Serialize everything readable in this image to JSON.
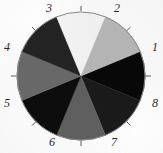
{
  "figure": {
    "kind": "pie-chart",
    "background_color": "#fdfdfd",
    "outline_color": "#8a8a8a",
    "label_color": "#2b2b2b",
    "tick_color": "#4a4a4a",
    "center_x": 66,
    "center_y": 66,
    "radius": 64
  },
  "chart_data": {
    "type": "pie",
    "title": "",
    "subtitle": "",
    "xlabel": "",
    "ylabel": "",
    "legend_position": "none",
    "grid": false,
    "labels_outside": true,
    "start_angle_deg": 0,
    "direction": "clockwise",
    "slice_count": 8,
    "categories": [
      "1",
      "2",
      "3",
      "4",
      "5",
      "6",
      "7",
      "8"
    ],
    "values": [
      12.5,
      12.5,
      12.5,
      12.5,
      12.5,
      12.5,
      12.5,
      12.5
    ],
    "angles_deg": [
      45,
      45,
      45,
      45,
      45,
      45,
      45,
      45
    ],
    "colors": [
      "#080808",
      "#1a1a1a",
      "#606060",
      "#0d0d0d",
      "#6a6a6a",
      "#232323",
      "#f5f5f5",
      "#b8b8b8"
    ],
    "slices": [
      {
        "label": "1",
        "value": 12.5,
        "angle_deg": 45,
        "color": "#080808",
        "start_deg": -22.5,
        "end_deg": 22.5,
        "label_x": 152,
        "label_y": 41
      },
      {
        "label": "2",
        "value": 12.5,
        "angle_deg": 45,
        "color": "#1a1a1a",
        "start_deg": -67.5,
        "end_deg": -22.5,
        "label_x": 114,
        "label_y": 2
      },
      {
        "label": "3",
        "value": 12.5,
        "angle_deg": 45,
        "color": "#606060",
        "start_deg": -112.5,
        "end_deg": -67.5,
        "label_x": 46,
        "label_y": 2
      },
      {
        "label": "4",
        "value": 12.5,
        "angle_deg": 45,
        "color": "#0d0d0d",
        "start_deg": -157.5,
        "end_deg": -112.5,
        "label_x": 4,
        "label_y": 41
      },
      {
        "label": "5",
        "value": 12.5,
        "angle_deg": 45,
        "color": "#6a6a6a",
        "start_deg": 157.5,
        "end_deg": -157.5,
        "label_x": 4,
        "label_y": 97
      },
      {
        "label": "6",
        "value": 12.5,
        "angle_deg": 45,
        "color": "#232323",
        "start_deg": 112.5,
        "end_deg": 157.5,
        "label_x": 49,
        "label_y": 136
      },
      {
        "label": "7",
        "value": 12.5,
        "angle_deg": 45,
        "color": "#f5f5f5",
        "start_deg": 67.5,
        "end_deg": 112.5,
        "label_x": 111,
        "label_y": 136
      },
      {
        "label": "8",
        "value": 12.5,
        "angle_deg": 45,
        "color": "#b8b8b8",
        "start_deg": 22.5,
        "end_deg": 67.5,
        "label_x": 152,
        "label_y": 97
      }
    ]
  }
}
